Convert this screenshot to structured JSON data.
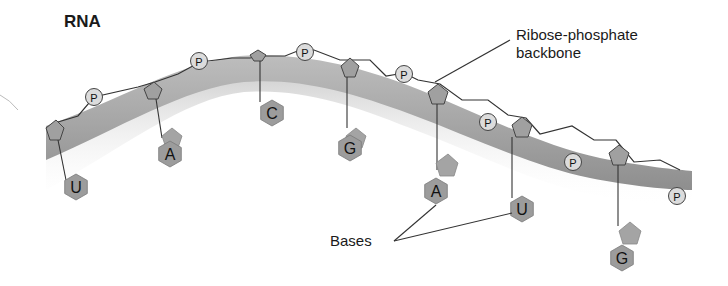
{
  "title": "RNA",
  "labels": {
    "backbone": "Ribose-phosphate backbone",
    "bases": "Bases"
  },
  "phosphate_label": "P",
  "bases": [
    {
      "letter": "U",
      "cx": 76,
      "cy": 187
    },
    {
      "letter": "A",
      "cx": 170,
      "cy": 154
    },
    {
      "letter": "C",
      "cx": 272,
      "cy": 113
    },
    {
      "letter": "G",
      "cx": 350,
      "cy": 148
    },
    {
      "letter": "A",
      "cx": 436,
      "cy": 191
    },
    {
      "letter": "U",
      "cx": 522,
      "cy": 209
    },
    {
      "letter": "G",
      "cx": 622,
      "cy": 258
    }
  ],
  "colors": {
    "backbone_band": "#a8a8a8",
    "base_fill": "#9c9c9c",
    "phosphate_fill": "#d8d8d8",
    "line": "#333333",
    "text": "#1a1a1a"
  }
}
